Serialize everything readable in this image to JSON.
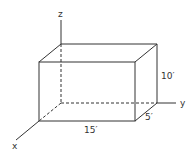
{
  "diagram": {
    "type": "rectangular-box-3d",
    "axes": {
      "x_label": "x",
      "y_label": "y",
      "z_label": "z"
    },
    "dimensions": {
      "length_label": "15′",
      "height_label": "10′",
      "depth_label": "5′"
    },
    "colors": {
      "line": "#333333",
      "background": "#ffffff"
    }
  }
}
